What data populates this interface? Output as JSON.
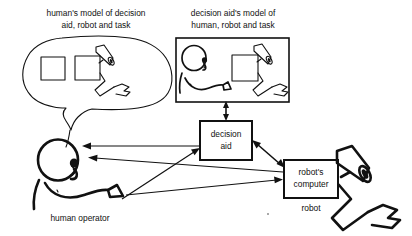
{
  "diagram": {
    "background_color": "#ffffff",
    "ink_color": "#111111",
    "captions": {
      "human_model_line1": "human's model of decision",
      "human_model_line2": "aid, robot and task",
      "aid_model_line1": "decision aid's model of",
      "aid_model_line2": "human, robot and task",
      "human_operator": "human operator",
      "robot": "robot"
    },
    "boxes": {
      "decision_aid_line1": "decision",
      "decision_aid_line2": "aid",
      "robot_computer_line1": "robot's",
      "robot_computer_line2": "computer"
    },
    "icons": {
      "thought_bubble": "thought-bubble",
      "model_panel": "model-panel",
      "human_head": "human-head",
      "human_arm": "human-arm",
      "robot_camera": "robot-camera",
      "robot_arm": "robot-arm",
      "robot_gripper": "robot-gripper",
      "task_square": "task-square",
      "decision_aid_square": "decision-aid-square"
    },
    "arrows": [
      {
        "name": "aid-to-model-bidirectional",
        "from": "decision aid",
        "to": "decision aid's model",
        "heads": "both"
      },
      {
        "name": "aid-to-human-head",
        "from": "decision aid",
        "to": "human operator head",
        "heads": "single"
      },
      {
        "name": "robot-computer-to-human-head",
        "from": "robot's computer",
        "to": "human operator head",
        "heads": "single"
      },
      {
        "name": "human-hand-to-decision-aid",
        "from": "human operator hand",
        "to": "decision aid",
        "heads": "single"
      },
      {
        "name": "human-hand-to-robot-computer",
        "from": "human operator hand",
        "to": "robot's computer",
        "heads": "single"
      },
      {
        "name": "aid-to-robot-computer-bidirectional",
        "from": "decision aid",
        "to": "robot's computer",
        "heads": "both"
      }
    ]
  }
}
